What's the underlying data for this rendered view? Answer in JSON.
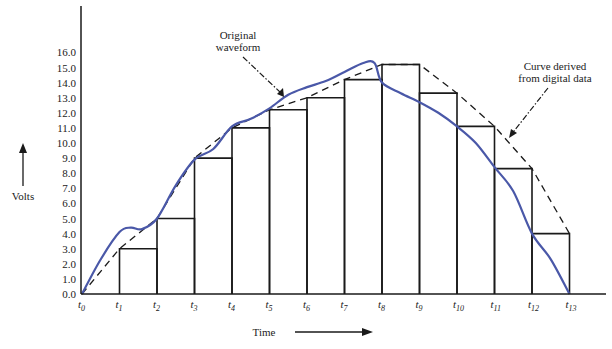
{
  "chart_data": {
    "type": "line",
    "title": "",
    "xlabel": "Time",
    "ylabel": "Volts",
    "ylim": [
      0,
      16
    ],
    "grid": false,
    "y_ticks": [
      "0.0",
      "1.0",
      "2.0",
      "3.0",
      "4.0",
      "5.0",
      "6.0",
      "7.0",
      "8.0",
      "9.0",
      "10.0",
      "11.0",
      "12.0",
      "13.0",
      "14.0",
      "15.0",
      "16.0"
    ],
    "x_ticks": [
      {
        "base": "t",
        "sub": "0"
      },
      {
        "base": "t",
        "sub": "1"
      },
      {
        "base": "t",
        "sub": "2"
      },
      {
        "base": "t",
        "sub": "3"
      },
      {
        "base": "t",
        "sub": "4"
      },
      {
        "base": "t",
        "sub": "5"
      },
      {
        "base": "t",
        "sub": "6"
      },
      {
        "base": "t",
        "sub": "7"
      },
      {
        "base": "t",
        "sub": "8"
      },
      {
        "base": "t",
        "sub": "9"
      },
      {
        "base": "t",
        "sub": "10"
      },
      {
        "base": "t",
        "sub": "11"
      },
      {
        "base": "t",
        "sub": "12"
      },
      {
        "base": "t",
        "sub": "13"
      }
    ],
    "series": [
      {
        "name": "Sampled digital values (staircase)",
        "style": "step",
        "color": "#1a1a1a",
        "note": "bar starting at t_i extends to t_{i+1}",
        "x": [
          1,
          2,
          3,
          4,
          5,
          6,
          7,
          8,
          9,
          10,
          11,
          12
        ],
        "values": [
          3.0,
          5.0,
          9.0,
          11.0,
          12.2,
          13.0,
          14.2,
          15.2,
          13.3,
          11.1,
          8.3,
          4.0
        ]
      },
      {
        "name": "Curve derived from digital data",
        "style": "dashed",
        "color": "#1a1a1a",
        "x": [
          0,
          1,
          2,
          3,
          4,
          5,
          6,
          7,
          8,
          9,
          10,
          11,
          12,
          13
        ],
        "values": [
          0,
          3.0,
          5.0,
          9.0,
          11.0,
          12.2,
          13.0,
          14.2,
          15.2,
          15.2,
          13.3,
          11.1,
          8.3,
          4.0
        ]
      },
      {
        "name": "Original waveform",
        "style": "solid",
        "color": "#4a58a8",
        "x": [
          0,
          0.5,
          1.0,
          1.3,
          1.6,
          2.0,
          2.5,
          3.0,
          3.5,
          4.0,
          4.5,
          5.0,
          5.5,
          6.0,
          6.5,
          7.0,
          7.5,
          7.8,
          8.0,
          8.5,
          9.0,
          9.5,
          10.0,
          10.5,
          11.0,
          11.5,
          12.0,
          12.5,
          13.0
        ],
        "values": [
          0,
          2.3,
          4.1,
          4.4,
          4.3,
          5.0,
          7.2,
          8.9,
          9.6,
          11.1,
          11.6,
          12.3,
          13.2,
          13.7,
          14.1,
          14.7,
          15.3,
          15.3,
          14.0,
          13.3,
          12.7,
          12.0,
          11.1,
          10.0,
          8.4,
          6.8,
          4.0,
          2.3,
          0
        ]
      }
    ],
    "annotations": [
      {
        "text_lines": [
          "Original",
          "waveform"
        ],
        "target": "Original waveform"
      },
      {
        "text_lines": [
          "Curve derived",
          "from digital data"
        ],
        "target": "Curve derived from digital data"
      }
    ]
  },
  "labels": {
    "ylabel": "Volts",
    "xlabel": "Time",
    "annot_original_1": "Original",
    "annot_original_2": "waveform",
    "annot_derived_1": "Curve derived",
    "annot_derived_2": "from digital data"
  }
}
